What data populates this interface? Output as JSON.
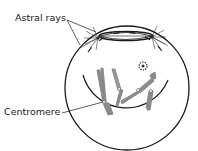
{
  "labels": {
    "astral_rays": "Astral rays",
    "centromere": "Centromere"
  },
  "colors": {
    "line": "#1a1a1a",
    "chromosome": "#8a8a8a",
    "background": "#ffffff"
  }
}
